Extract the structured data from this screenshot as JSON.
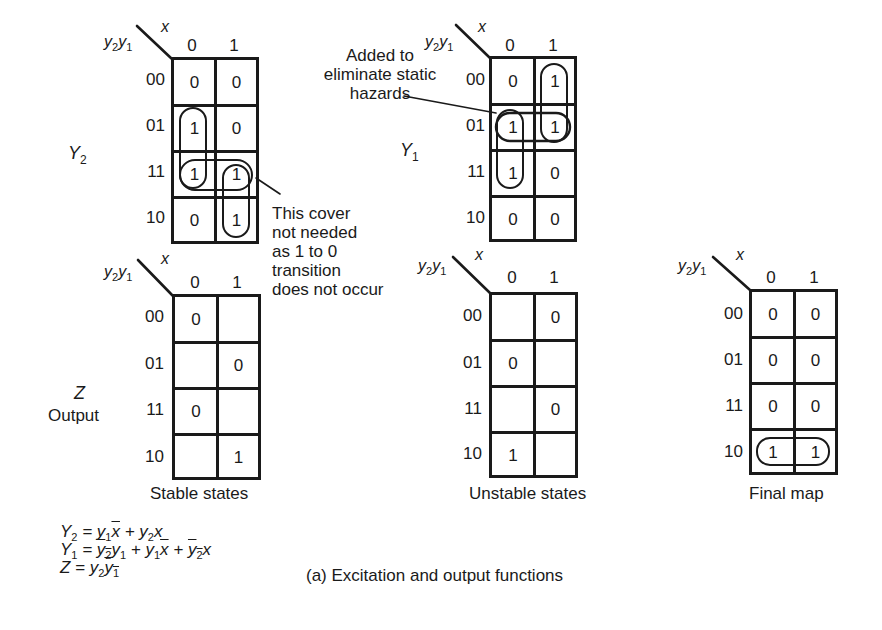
{
  "figure": {
    "caption": "(a)  Excitation and output functions",
    "row_axis_label": "y2y1",
    "col_axis_label": "x",
    "column_headers": [
      "0",
      "1"
    ],
    "row_headers": [
      "00",
      "01",
      "11",
      "10"
    ]
  },
  "maps": {
    "Y2": {
      "function_label": "Y",
      "function_sub": "2",
      "cells": [
        [
          "0",
          "0"
        ],
        [
          "1",
          "0"
        ],
        [
          "1",
          "1"
        ],
        [
          "0",
          "1"
        ]
      ],
      "loops": [
        "column x=0 rows 01-11",
        "row 11 both columns",
        "column x=1 rows 11-10 (not needed)"
      ]
    },
    "Y1": {
      "function_label": "Y",
      "function_sub": "1",
      "cells": [
        [
          "0",
          "1"
        ],
        [
          "1",
          "1"
        ],
        [
          "1",
          "0"
        ],
        [
          "0",
          "0"
        ]
      ],
      "loops": [
        "column x=1 rows 00-01",
        "row 01 both columns (hazard cover)",
        "column x=0 rows 01-11"
      ]
    },
    "Z_stable": {
      "function_label": "Z",
      "function_caption": "Output",
      "caption": "Stable states",
      "cells": [
        [
          "0",
          ""
        ],
        [
          "",
          "0"
        ],
        [
          "0",
          ""
        ],
        [
          "",
          "1"
        ]
      ]
    },
    "Z_unstable": {
      "caption": "Unstable states",
      "cells": [
        [
          "",
          "0"
        ],
        [
          "0",
          ""
        ],
        [
          "",
          "0"
        ],
        [
          "1",
          ""
        ]
      ]
    },
    "Z_final": {
      "caption": "Final map",
      "cells": [
        [
          "0",
          "0"
        ],
        [
          "0",
          "0"
        ],
        [
          "0",
          "0"
        ],
        [
          "1",
          "1"
        ]
      ],
      "loops": [
        "row 10 both columns"
      ]
    }
  },
  "annotations": {
    "hazard_note": [
      "Added to",
      "eliminate static",
      "hazards"
    ],
    "cover_note": [
      "This cover",
      "not needed",
      "as 1 to 0",
      "transition",
      "does not occur"
    ]
  },
  "equations": {
    "Y2": {
      "lhs": "Y",
      "lhs_sub": "2"
    },
    "Y1": {
      "lhs": "Y",
      "lhs_sub": "1"
    },
    "Z": {
      "lhs": "Z"
    }
  }
}
